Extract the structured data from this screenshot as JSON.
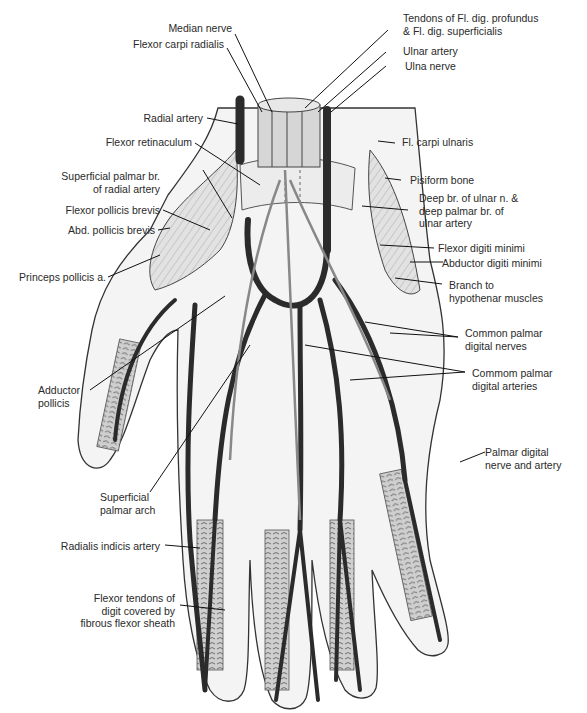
{
  "figure": {
    "colors": {
      "background": "#ffffff",
      "artery": "#2b2b2b",
      "outline": "#333333",
      "muscle_fill": "#d8d8d8",
      "text": "#2a2a2a"
    }
  },
  "labels": {
    "median_nerve": "Median nerve",
    "flexor_carpi_radialis": "Flexor carpi radialis",
    "tendons_fl_dig": "Tendons of Fl. dig. profundus\n& Fl. dig. superficialis",
    "ulnar_artery": "Ulnar artery",
    "ulna_nerve": "Ulna nerve",
    "radial_artery": "Radial artery",
    "flexor_retinaculum": "Flexor retinaculum",
    "fl_carpi_ulnaris": "Fl. carpi ulnaris",
    "superficial_palmar_br": "Superficial palmar br.\nof radial artery",
    "pisiform_bone": "Pisiform bone",
    "deep_br_ulnar": "Deep br. of ulnar n. &\ndeep palmar br. of\nulnar artery",
    "flexor_pollicis_brevis": "Flexor pollicis brevis",
    "abd_pollicis_brevis": "Abd. pollicis brevis",
    "flexor_digiti_minimi": "Flexor digiti minimi",
    "abductor_digiti_minimi": "Abductor digiti minimi",
    "princeps_pollicis": "Princeps pollicis a.",
    "branch_hypothenar": "Branch to\nhypothenar muscles",
    "common_palmar_nerves": "Common palmar\ndigital nerves",
    "adductor_pollicis": "Adductor\npollicis",
    "common_palmar_arteries": "Commom palmar\ndigital arteries",
    "palmar_digital_nerve_artery": "Palmar digital\nnerve and artery",
    "superficial_palmar_arch": "Superficial\npalmar arch",
    "radialis_indicis": "Radialis indicis artery",
    "flexor_tendons_digit": "Flexor tendons of\ndigit covered by\nfibrous flexor sheath"
  }
}
